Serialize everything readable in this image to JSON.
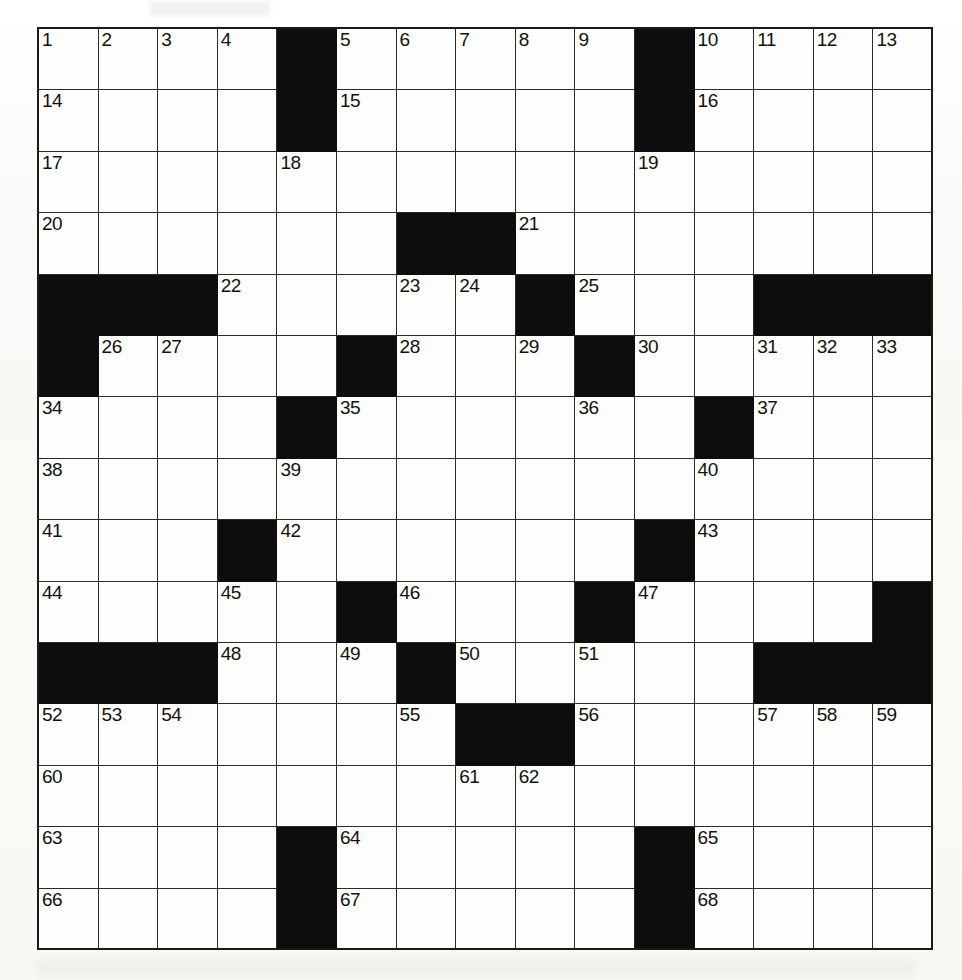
{
  "puzzle": {
    "type": "crossword-grid",
    "rows": 15,
    "cols": 15,
    "colors": {
      "block": "#0d0d0d",
      "cell": "#fdfdfb",
      "grid_line": "#2a2a2a",
      "number_text": "#111111",
      "page_background": "#ffffff"
    },
    "grid": [
      [
        {
          "block": false,
          "number": "1"
        },
        {
          "block": false,
          "number": "2"
        },
        {
          "block": false,
          "number": "3"
        },
        {
          "block": false,
          "number": "4"
        },
        {
          "block": true,
          "number": ""
        },
        {
          "block": false,
          "number": "5"
        },
        {
          "block": false,
          "number": "6"
        },
        {
          "block": false,
          "number": "7"
        },
        {
          "block": false,
          "number": "8"
        },
        {
          "block": false,
          "number": "9"
        },
        {
          "block": true,
          "number": ""
        },
        {
          "block": false,
          "number": "10"
        },
        {
          "block": false,
          "number": "11"
        },
        {
          "block": false,
          "number": "12"
        },
        {
          "block": false,
          "number": "13"
        }
      ],
      [
        {
          "block": false,
          "number": "14"
        },
        {
          "block": false,
          "number": ""
        },
        {
          "block": false,
          "number": ""
        },
        {
          "block": false,
          "number": ""
        },
        {
          "block": true,
          "number": ""
        },
        {
          "block": false,
          "number": "15"
        },
        {
          "block": false,
          "number": ""
        },
        {
          "block": false,
          "number": ""
        },
        {
          "block": false,
          "number": ""
        },
        {
          "block": false,
          "number": ""
        },
        {
          "block": true,
          "number": ""
        },
        {
          "block": false,
          "number": "16"
        },
        {
          "block": false,
          "number": ""
        },
        {
          "block": false,
          "number": ""
        },
        {
          "block": false,
          "number": ""
        }
      ],
      [
        {
          "block": false,
          "number": "17"
        },
        {
          "block": false,
          "number": ""
        },
        {
          "block": false,
          "number": ""
        },
        {
          "block": false,
          "number": ""
        },
        {
          "block": false,
          "number": "18"
        },
        {
          "block": false,
          "number": ""
        },
        {
          "block": false,
          "number": ""
        },
        {
          "block": false,
          "number": ""
        },
        {
          "block": false,
          "number": ""
        },
        {
          "block": false,
          "number": ""
        },
        {
          "block": false,
          "number": "19"
        },
        {
          "block": false,
          "number": ""
        },
        {
          "block": false,
          "number": ""
        },
        {
          "block": false,
          "number": ""
        },
        {
          "block": false,
          "number": ""
        }
      ],
      [
        {
          "block": false,
          "number": "20"
        },
        {
          "block": false,
          "number": ""
        },
        {
          "block": false,
          "number": ""
        },
        {
          "block": false,
          "number": ""
        },
        {
          "block": false,
          "number": ""
        },
        {
          "block": false,
          "number": ""
        },
        {
          "block": true,
          "number": ""
        },
        {
          "block": true,
          "number": ""
        },
        {
          "block": false,
          "number": "21"
        },
        {
          "block": false,
          "number": ""
        },
        {
          "block": false,
          "number": ""
        },
        {
          "block": false,
          "number": ""
        },
        {
          "block": false,
          "number": ""
        },
        {
          "block": false,
          "number": ""
        },
        {
          "block": false,
          "number": ""
        }
      ],
      [
        {
          "block": true,
          "number": ""
        },
        {
          "block": true,
          "number": ""
        },
        {
          "block": true,
          "number": ""
        },
        {
          "block": false,
          "number": "22"
        },
        {
          "block": false,
          "number": ""
        },
        {
          "block": false,
          "number": ""
        },
        {
          "block": false,
          "number": "23"
        },
        {
          "block": false,
          "number": "24"
        },
        {
          "block": true,
          "number": ""
        },
        {
          "block": false,
          "number": "25"
        },
        {
          "block": false,
          "number": ""
        },
        {
          "block": false,
          "number": ""
        },
        {
          "block": true,
          "number": ""
        },
        {
          "block": true,
          "number": ""
        },
        {
          "block": true,
          "number": ""
        }
      ],
      [
        {
          "block": true,
          "number": ""
        },
        {
          "block": false,
          "number": "26"
        },
        {
          "block": false,
          "number": "27"
        },
        {
          "block": false,
          "number": ""
        },
        {
          "block": false,
          "number": ""
        },
        {
          "block": true,
          "number": ""
        },
        {
          "block": false,
          "number": "28"
        },
        {
          "block": false,
          "number": ""
        },
        {
          "block": false,
          "number": "29"
        },
        {
          "block": true,
          "number": ""
        },
        {
          "block": false,
          "number": "30"
        },
        {
          "block": false,
          "number": ""
        },
        {
          "block": false,
          "number": "31"
        },
        {
          "block": false,
          "number": "32"
        },
        {
          "block": false,
          "number": "33"
        }
      ],
      [
        {
          "block": false,
          "number": "34"
        },
        {
          "block": false,
          "number": ""
        },
        {
          "block": false,
          "number": ""
        },
        {
          "block": false,
          "number": ""
        },
        {
          "block": true,
          "number": ""
        },
        {
          "block": false,
          "number": "35"
        },
        {
          "block": false,
          "number": ""
        },
        {
          "block": false,
          "number": ""
        },
        {
          "block": false,
          "number": ""
        },
        {
          "block": false,
          "number": "36"
        },
        {
          "block": false,
          "number": ""
        },
        {
          "block": true,
          "number": ""
        },
        {
          "block": false,
          "number": "37"
        },
        {
          "block": false,
          "number": ""
        },
        {
          "block": false,
          "number": ""
        }
      ],
      [
        {
          "block": false,
          "number": "38"
        },
        {
          "block": false,
          "number": ""
        },
        {
          "block": false,
          "number": ""
        },
        {
          "block": false,
          "number": ""
        },
        {
          "block": false,
          "number": "39"
        },
        {
          "block": false,
          "number": ""
        },
        {
          "block": false,
          "number": ""
        },
        {
          "block": false,
          "number": ""
        },
        {
          "block": false,
          "number": ""
        },
        {
          "block": false,
          "number": ""
        },
        {
          "block": false,
          "number": ""
        },
        {
          "block": false,
          "number": "40"
        },
        {
          "block": false,
          "number": ""
        },
        {
          "block": false,
          "number": ""
        },
        {
          "block": false,
          "number": ""
        }
      ],
      [
        {
          "block": false,
          "number": "41"
        },
        {
          "block": false,
          "number": ""
        },
        {
          "block": false,
          "number": ""
        },
        {
          "block": true,
          "number": ""
        },
        {
          "block": false,
          "number": "42"
        },
        {
          "block": false,
          "number": ""
        },
        {
          "block": false,
          "number": ""
        },
        {
          "block": false,
          "number": ""
        },
        {
          "block": false,
          "number": ""
        },
        {
          "block": false,
          "number": ""
        },
        {
          "block": true,
          "number": ""
        },
        {
          "block": false,
          "number": "43"
        },
        {
          "block": false,
          "number": ""
        },
        {
          "block": false,
          "number": ""
        },
        {
          "block": false,
          "number": ""
        }
      ],
      [
        {
          "block": false,
          "number": "44"
        },
        {
          "block": false,
          "number": ""
        },
        {
          "block": false,
          "number": ""
        },
        {
          "block": false,
          "number": "45"
        },
        {
          "block": false,
          "number": ""
        },
        {
          "block": true,
          "number": ""
        },
        {
          "block": false,
          "number": "46"
        },
        {
          "block": false,
          "number": ""
        },
        {
          "block": false,
          "number": ""
        },
        {
          "block": true,
          "number": ""
        },
        {
          "block": false,
          "number": "47"
        },
        {
          "block": false,
          "number": ""
        },
        {
          "block": false,
          "number": ""
        },
        {
          "block": false,
          "number": ""
        },
        {
          "block": true,
          "number": ""
        }
      ],
      [
        {
          "block": true,
          "number": ""
        },
        {
          "block": true,
          "number": ""
        },
        {
          "block": true,
          "number": ""
        },
        {
          "block": false,
          "number": "48"
        },
        {
          "block": false,
          "number": ""
        },
        {
          "block": false,
          "number": "49"
        },
        {
          "block": true,
          "number": ""
        },
        {
          "block": false,
          "number": "50"
        },
        {
          "block": false,
          "number": ""
        },
        {
          "block": false,
          "number": "51"
        },
        {
          "block": false,
          "number": ""
        },
        {
          "block": false,
          "number": ""
        },
        {
          "block": true,
          "number": ""
        },
        {
          "block": true,
          "number": ""
        },
        {
          "block": true,
          "number": ""
        }
      ],
      [
        {
          "block": false,
          "number": "52"
        },
        {
          "block": false,
          "number": "53"
        },
        {
          "block": false,
          "number": "54"
        },
        {
          "block": false,
          "number": ""
        },
        {
          "block": false,
          "number": ""
        },
        {
          "block": false,
          "number": ""
        },
        {
          "block": false,
          "number": "55"
        },
        {
          "block": true,
          "number": ""
        },
        {
          "block": true,
          "number": ""
        },
        {
          "block": false,
          "number": "56"
        },
        {
          "block": false,
          "number": ""
        },
        {
          "block": false,
          "number": ""
        },
        {
          "block": false,
          "number": "57"
        },
        {
          "block": false,
          "number": "58"
        },
        {
          "block": false,
          "number": "59"
        }
      ],
      [
        {
          "block": false,
          "number": "60"
        },
        {
          "block": false,
          "number": ""
        },
        {
          "block": false,
          "number": ""
        },
        {
          "block": false,
          "number": ""
        },
        {
          "block": false,
          "number": ""
        },
        {
          "block": false,
          "number": ""
        },
        {
          "block": false,
          "number": ""
        },
        {
          "block": false,
          "number": "61"
        },
        {
          "block": false,
          "number": "62"
        },
        {
          "block": false,
          "number": ""
        },
        {
          "block": false,
          "number": ""
        },
        {
          "block": false,
          "number": ""
        },
        {
          "block": false,
          "number": ""
        },
        {
          "block": false,
          "number": ""
        },
        {
          "block": false,
          "number": ""
        }
      ],
      [
        {
          "block": false,
          "number": "63"
        },
        {
          "block": false,
          "number": ""
        },
        {
          "block": false,
          "number": ""
        },
        {
          "block": false,
          "number": ""
        },
        {
          "block": true,
          "number": ""
        },
        {
          "block": false,
          "number": "64"
        },
        {
          "block": false,
          "number": ""
        },
        {
          "block": false,
          "number": ""
        },
        {
          "block": false,
          "number": ""
        },
        {
          "block": false,
          "number": ""
        },
        {
          "block": true,
          "number": ""
        },
        {
          "block": false,
          "number": "65"
        },
        {
          "block": false,
          "number": ""
        },
        {
          "block": false,
          "number": ""
        },
        {
          "block": false,
          "number": ""
        }
      ],
      [
        {
          "block": false,
          "number": "66"
        },
        {
          "block": false,
          "number": ""
        },
        {
          "block": false,
          "number": ""
        },
        {
          "block": false,
          "number": ""
        },
        {
          "block": true,
          "number": ""
        },
        {
          "block": false,
          "number": "67"
        },
        {
          "block": false,
          "number": ""
        },
        {
          "block": false,
          "number": ""
        },
        {
          "block": false,
          "number": ""
        },
        {
          "block": false,
          "number": ""
        },
        {
          "block": true,
          "number": ""
        },
        {
          "block": false,
          "number": "68"
        },
        {
          "block": false,
          "number": ""
        },
        {
          "block": false,
          "number": ""
        },
        {
          "block": false,
          "number": ""
        }
      ]
    ]
  }
}
